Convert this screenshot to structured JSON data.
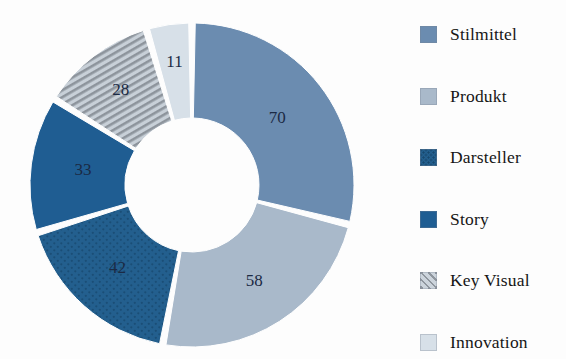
{
  "chart_data": {
    "type": "pie",
    "variant": "donut",
    "title": "",
    "subtitle": "",
    "xlabel": "",
    "ylabel": "",
    "grid": false,
    "legend_position": "right",
    "start_angle_deg": 0,
    "direction": "clockwise",
    "total": 242,
    "categories": [
      "Stilmittel",
      "Produkt",
      "Darsteller",
      "Story",
      "Key Visual",
      "Innovation"
    ],
    "values": [
      70,
      58,
      42,
      33,
      28,
      11
    ],
    "data_labels": [
      "70",
      "58",
      "42",
      "33",
      "28",
      "11"
    ],
    "slices": [
      {
        "label": "Stilmittel",
        "value": 70,
        "data_label": "70",
        "color": "#6b8cb0",
        "pattern": "solid",
        "start_deg": 0,
        "end_deg": 104.13
      },
      {
        "label": "Produkt",
        "value": 58,
        "data_label": "58",
        "color": "#a9b9ca",
        "pattern": "solid",
        "start_deg": 104.13,
        "end_deg": 190.41
      },
      {
        "label": "Darsteller",
        "value": 42,
        "data_label": "42",
        "color": "#235f8e",
        "pattern": "dotted-texture",
        "start_deg": 190.41,
        "end_deg": 252.89
      },
      {
        "label": "Story",
        "value": 33,
        "data_label": "33",
        "color": "#1f5d92",
        "pattern": "solid",
        "start_deg": 252.89,
        "end_deg": 301.98
      },
      {
        "label": "Key Visual",
        "value": 28,
        "data_label": "28",
        "color": "#c2cbd4",
        "pattern": "diagonal-stripes",
        "start_deg": 301.98,
        "end_deg": 343.64
      },
      {
        "label": "Innovation",
        "value": 11,
        "data_label": "11",
        "color": "#d7e0e8",
        "pattern": "solid",
        "start_deg": 343.64,
        "end_deg": 360
      }
    ]
  },
  "legend": {
    "items": [
      {
        "label": "Stilmittel",
        "color": "#6b8cb0",
        "pattern": "solid",
        "swatch_name": "legend-swatch-stilmittel"
      },
      {
        "label": "Produkt",
        "color": "#a9b9ca",
        "pattern": "solid",
        "swatch_name": "legend-swatch-produkt"
      },
      {
        "label": "Darsteller",
        "color": "#235f8e",
        "pattern": "dotted-texture",
        "swatch_name": "legend-swatch-darsteller"
      },
      {
        "label": "Story",
        "color": "#1f5d92",
        "pattern": "solid",
        "swatch_name": "legend-swatch-story"
      },
      {
        "label": "Key Visual",
        "color": "#c2cbd4",
        "pattern": "diagonal-stripes",
        "swatch_name": "legend-swatch-key-visual"
      },
      {
        "label": "Innovation",
        "color": "#d7e0e8",
        "pattern": "solid",
        "swatch_name": "legend-swatch-innovation"
      }
    ]
  },
  "colors": {
    "background": "#fdfdfd",
    "slice_separator": "#ffffff",
    "label_text": "#1b2a44",
    "legend_text": "#161616"
  }
}
